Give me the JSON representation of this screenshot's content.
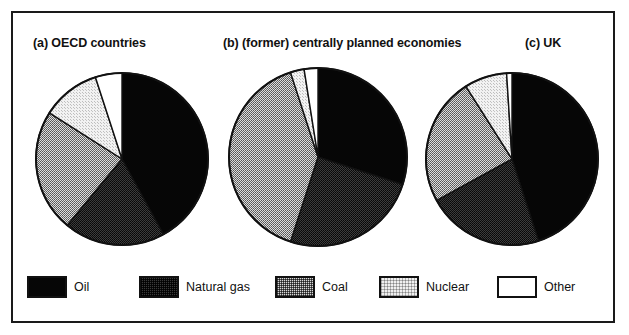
{
  "figure": {
    "background_color": "#ffffff",
    "frame_color": "#1a1a1a",
    "width": 629,
    "height": 335
  },
  "titles": {
    "a": "(a) OECD countries",
    "b": "(b) (former) centrally planned economies",
    "c": "(c) UK"
  },
  "legend": {
    "items": [
      {
        "label": "Oil",
        "fill": "fill-oil",
        "color": "#060606"
      },
      {
        "label": "Natural gas",
        "fill": "fill-gas",
        "color": "#3a3a3a"
      },
      {
        "label": "Coal",
        "fill": "fill-coal",
        "color": "#b5b5b5"
      },
      {
        "label": "Nuclear",
        "fill": "fill-nuclear",
        "color": "#ececec"
      },
      {
        "label": "Other",
        "fill": "fill-other",
        "color": "#ffffff"
      }
    ]
  },
  "chart_data": {
    "type": "pie",
    "title": "",
    "subtitle": "",
    "legend_position": "bottom",
    "categories": [
      "Oil",
      "Natural gas",
      "Coal",
      "Nuclear",
      "Other"
    ],
    "colors": [
      "#060606",
      "#3a3a3a",
      "#b5b5b5",
      "#ececec",
      "#ffffff"
    ],
    "start_angle_deg": 0,
    "direction": "clockwise",
    "units": "percent of primary energy consumption",
    "charts": [
      {
        "id": "a",
        "label": "(a) OECD countries",
        "radius_px": 87,
        "values": [
          42,
          19,
          23,
          11,
          5
        ]
      },
      {
        "id": "b",
        "label": "(b) (former) centrally planned economies",
        "radius_px": 90,
        "values": [
          30,
          25,
          40,
          2.5,
          2.5
        ]
      },
      {
        "id": "c",
        "label": "(c) UK",
        "radius_px": 87,
        "values": [
          45,
          22,
          24,
          8,
          1
        ]
      }
    ]
  }
}
